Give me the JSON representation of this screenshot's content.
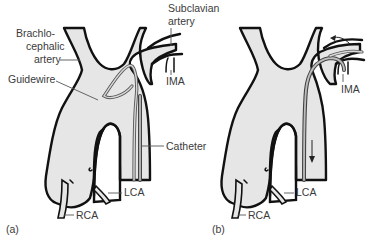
{
  "figure": {
    "type": "medical-illustration",
    "fill_color": "#e6e6e6",
    "outline_color": "#111111",
    "label_color": "#3a3a3a"
  },
  "panels": [
    {
      "id": "a",
      "panel_label": "(a)",
      "labels": {
        "brachiocephalic_line1": "Brachlo-",
        "brachiocephalic_line2": "cephalic",
        "brachiocephalic_line3": "artery",
        "subclavian_line1": "Subclavian",
        "subclavian_line2": "artery",
        "guidewire": "Guidewire",
        "ima": "IMA",
        "catheter": "Catheter",
        "lca": "LCA",
        "rca": "RCA"
      }
    },
    {
      "id": "b",
      "panel_label": "(b)",
      "labels": {
        "ima": "IMA",
        "lca": "LCA",
        "rca": "RCA"
      },
      "arrows": [
        "curved arrow toward subclavian artery",
        "downward arrow along descending aorta"
      ]
    }
  ]
}
